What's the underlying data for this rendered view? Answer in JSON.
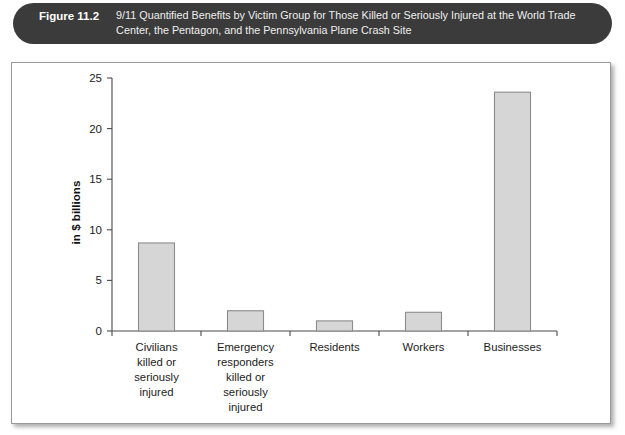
{
  "figure": {
    "label": "Figure 11.2",
    "caption_line1": "9/11 Quantified Benefits by Victim Group for Those Killed or Seriously Injured at the World Trade",
    "caption_line2": "Center, the Pentagon, and the Pennsylvania Plane Crash Site",
    "caption_full": "9/11 Quantified Benefits by Victim Group for Those Killed or Seriously Injured at the World Trade Center, the Pentagon, and the Pennsylvania Plane Crash Site"
  },
  "colors": {
    "banner_background": "#3b3b3b",
    "banner_text": "#ffffff",
    "panel_background": "#ffffff",
    "panel_border": "#9a9a9a",
    "bar_fill": "#d6d6d6",
    "bar_stroke": "#8c8c8c",
    "axis": "#4a4a4a"
  },
  "chart_data": {
    "type": "bar",
    "title": "",
    "xlabel": "",
    "ylabel": "in $ billions",
    "ylim": [
      0,
      25
    ],
    "yticks": [
      0,
      5,
      10,
      15,
      20,
      25
    ],
    "ytick_labels": [
      "0",
      "5",
      "10",
      "15",
      "20",
      "25"
    ],
    "grid": false,
    "legend": "none",
    "categories": [
      "Civilians killed or seriously injured",
      "Emergency responders killed or seriously injured",
      "Residents",
      "Workers",
      "Businesses"
    ],
    "category_label_lines": [
      [
        "Civilians",
        "killed or",
        "seriously",
        "injured"
      ],
      [
        "Emergency",
        "responders",
        "killed or",
        "seriously",
        "injured"
      ],
      [
        "Residents"
      ],
      [
        "Workers"
      ],
      [
        "Businesses"
      ]
    ],
    "values": [
      8.7,
      2.0,
      1.0,
      1.85,
      23.6
    ]
  }
}
